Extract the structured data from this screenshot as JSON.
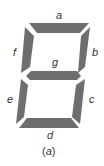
{
  "figure": {
    "caption_open": "(",
    "caption_letter": "a",
    "caption_close": ")",
    "segment_color": "#6e6e6e",
    "segments": {
      "a": "a",
      "b": "b",
      "c": "c",
      "d": "d",
      "e": "e",
      "f": "f",
      "g": "g"
    }
  }
}
